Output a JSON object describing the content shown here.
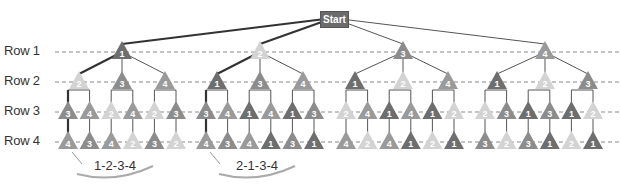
{
  "start_label": "Start",
  "row_labels": [
    "Row 1",
    "Row 2",
    "Row 3",
    "Row 4"
  ],
  "colors": {
    "1": "#6e6e6e",
    "2": "#d3d3d3",
    "3": "#8c8c8c",
    "4": "#9a9a9a",
    "line": "#555555",
    "highlight": "#333333",
    "dash": "#888888"
  },
  "tree": {
    "row1": [
      "1",
      "2",
      "3",
      "4"
    ],
    "row2": [
      [
        "2",
        "3",
        "4"
      ],
      [
        "1",
        "3",
        "4"
      ],
      [
        "1",
        "2",
        "4"
      ],
      [
        "1",
        "2",
        "3"
      ]
    ],
    "row3": [
      "3",
      "4",
      "2",
      "4",
      "2",
      "3",
      "3",
      "4",
      "1",
      "4",
      "1",
      "3",
      "2",
      "4",
      "1",
      "4",
      "1",
      "2",
      "2",
      "3",
      "1",
      "3",
      "1",
      "2"
    ],
    "row4": [
      "4",
      "3",
      "4",
      "2",
      "3",
      "2",
      "4",
      "3",
      "4",
      "1",
      "3",
      "1",
      "4",
      "2",
      "4",
      "1",
      "2",
      "1",
      "3",
      "2",
      "3",
      "1",
      "2",
      "1"
    ]
  },
  "highlighted_paths": [
    {
      "label": "1-2-3-4"
    },
    {
      "label": "2-1-3-4"
    }
  ]
}
